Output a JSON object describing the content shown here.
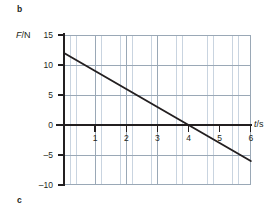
{
  "figure": {
    "part_label_b": "b",
    "part_label_c": "c"
  },
  "chart_data": {
    "type": "line",
    "title": "",
    "xlabel": "t/s",
    "ylabel": "F/N",
    "xlabel_symbol": "t",
    "xlabel_unit": "/s",
    "ylabel_symbol": "F",
    "ylabel_unit": "/N",
    "xlim": [
      0,
      6
    ],
    "ylim": [
      -10,
      15
    ],
    "xticks": [
      1,
      2,
      3,
      4,
      5,
      6
    ],
    "xtick_labels": [
      "1",
      "2",
      "3",
      "4",
      "5",
      "6"
    ],
    "yticks": [
      15,
      10,
      5,
      0,
      -5,
      -10
    ],
    "ytick_labels": [
      "15",
      "10",
      "5",
      "0",
      "-5",
      "-10"
    ],
    "grid": true,
    "grid_minor_spacing_x": 0.2,
    "grid_minor_spacing_y": 1,
    "grid_major_spacing_x": 1,
    "grid_major_spacing_y": 5,
    "legend": "none",
    "series": [
      {
        "name": "F vs t",
        "color": "#231f20",
        "x": [
          0,
          1,
          2,
          3,
          4,
          5,
          6
        ],
        "values": [
          12,
          9,
          6,
          3,
          0,
          -3,
          -6
        ],
        "intercept": 12,
        "slope": -3,
        "x_axis_crossing": 4
      }
    ]
  },
  "colors": {
    "line": "#231f20",
    "axis": "#231f20",
    "grid_minor": "#c9d4e0",
    "grid_major": "#9aa8b6",
    "background": "#ffffff"
  }
}
